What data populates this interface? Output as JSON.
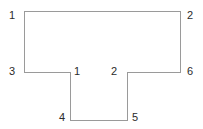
{
  "figure": {
    "kind": "t-shaped-polygon-diagram",
    "background_color": "#ffffff",
    "stroke_color": "#9a9a9a",
    "stroke_width": 1,
    "label_color": "#2b2b2b",
    "label_font_size_px": 11,
    "outline_points": "24,11 180,11 180,72 127,72 127,120 70,120 70,72 24,72",
    "segments": [
      {
        "name": "top-edge",
        "x1": 24,
        "y1": 11,
        "x2": 180,
        "y2": 11
      },
      {
        "name": "right-upper-edge",
        "x1": 180,
        "y1": 11,
        "x2": 180,
        "y2": 72
      },
      {
        "name": "right-shoulder",
        "x1": 180,
        "y1": 72,
        "x2": 127,
        "y2": 72
      },
      {
        "name": "stem-right-edge",
        "x1": 127,
        "y1": 72,
        "x2": 127,
        "y2": 120
      },
      {
        "name": "stem-bottom-edge",
        "x1": 127,
        "y1": 120,
        "x2": 70,
        "y2": 120
      },
      {
        "name": "stem-left-edge",
        "x1": 70,
        "y1": 120,
        "x2": 70,
        "y2": 72
      },
      {
        "name": "left-shoulder",
        "x1": 70,
        "y1": 72,
        "x2": 24,
        "y2": 72
      },
      {
        "name": "left-upper-edge",
        "x1": 24,
        "y1": 72,
        "x2": 24,
        "y2": 11
      }
    ],
    "labels": [
      {
        "id": "label-top-left",
        "text": "1",
        "x": 9,
        "y": 10
      },
      {
        "id": "label-top-right",
        "text": "2",
        "x": 187,
        "y": 10
      },
      {
        "id": "label-left-shoulder",
        "text": "3",
        "x": 9,
        "y": 66
      },
      {
        "id": "label-inner-left",
        "text": "1",
        "x": 74,
        "y": 66
      },
      {
        "id": "label-inner-right",
        "text": "2",
        "x": 111,
        "y": 66
      },
      {
        "id": "label-right-shoulder",
        "text": "6",
        "x": 187,
        "y": 66
      },
      {
        "id": "label-stem-bottom-left",
        "text": "4",
        "x": 59,
        "y": 112
      },
      {
        "id": "label-stem-bottom-right",
        "text": "5",
        "x": 132,
        "y": 112
      }
    ]
  }
}
